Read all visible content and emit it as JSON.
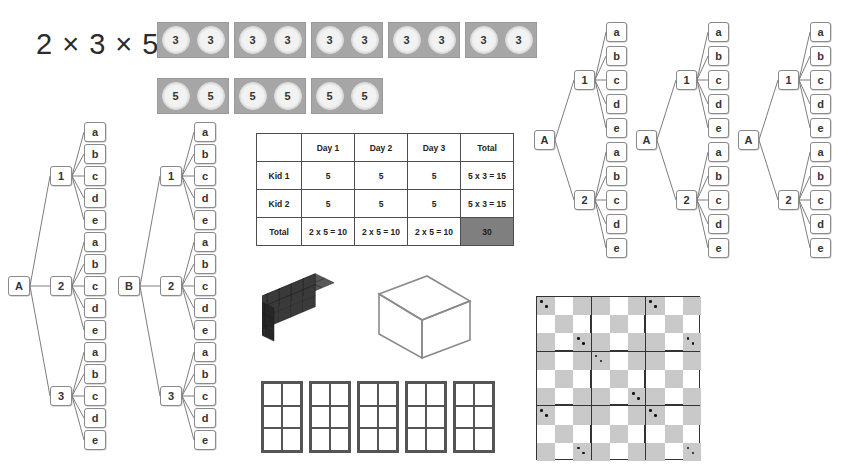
{
  "title": "2 × 3 × 5",
  "chips": {
    "rows": [
      {
        "value": "3",
        "count_boxes": 5,
        "per_box": [
          "3",
          "3"
        ]
      },
      {
        "value": "5",
        "count_boxes": 3,
        "per_box": [
          "5",
          "5"
        ]
      }
    ]
  },
  "table": {
    "corner": "",
    "columns": [
      "Day 1",
      "Day 2",
      "Day 3",
      "Total"
    ],
    "rows": [
      {
        "label": "Kid 1",
        "cells": [
          "5",
          "5",
          "5",
          "5 x 3 = 15"
        ]
      },
      {
        "label": "Kid 2",
        "cells": [
          "5",
          "5",
          "5",
          "5 x 3 = 15"
        ]
      },
      {
        "label": "Total",
        "cells": [
          "2 x 5 = 10",
          "2 x 5 = 10",
          "2 x 5 = 10",
          "30"
        ]
      }
    ],
    "grand_total": "30",
    "grand_total_bg": "#7f7f7f"
  },
  "trees_left": [
    {
      "name": "tree-A-3x5",
      "root": "A",
      "branches": [
        {
          "label": "1",
          "leaves": [
            "a",
            "b",
            "c",
            "d",
            "e"
          ]
        },
        {
          "label": "2",
          "leaves": [
            "a",
            "b",
            "c",
            "d",
            "e"
          ]
        },
        {
          "label": "3",
          "leaves": [
            "a",
            "b",
            "c",
            "d",
            "e"
          ]
        }
      ]
    },
    {
      "name": "tree-B-3x5",
      "root": "B",
      "branches": [
        {
          "label": "1",
          "leaves": [
            "a",
            "b",
            "c",
            "d",
            "e"
          ]
        },
        {
          "label": "2",
          "leaves": [
            "a",
            "b",
            "c",
            "d",
            "e"
          ]
        },
        {
          "label": "3",
          "leaves": [
            "a",
            "b",
            "c",
            "d",
            "e"
          ]
        }
      ]
    }
  ],
  "trees_right": [
    {
      "name": "tree-A-2x5-1",
      "root": "A",
      "branches": [
        {
          "label": "1",
          "leaves": [
            "a",
            "b",
            "c",
            "d",
            "e"
          ]
        },
        {
          "label": "2",
          "leaves": [
            "a",
            "b",
            "c",
            "d",
            "e"
          ]
        }
      ]
    },
    {
      "name": "tree-A-2x5-2",
      "root": "A",
      "branches": [
        {
          "label": "1",
          "leaves": [
            "a",
            "b",
            "c",
            "d",
            "e"
          ]
        },
        {
          "label": "2",
          "leaves": [
            "a",
            "b",
            "c",
            "d",
            "e"
          ]
        }
      ]
    },
    {
      "name": "tree-A-2x5-3",
      "root": "A",
      "branches": [
        {
          "label": "1",
          "leaves": [
            "a",
            "b",
            "c",
            "d",
            "e"
          ]
        },
        {
          "label": "2",
          "leaves": [
            "a",
            "b",
            "c",
            "d",
            "e"
          ]
        }
      ]
    }
  ],
  "solids": {
    "filled_block": {
      "name": "cube-stack",
      "units_x": 5,
      "units_y": 2,
      "units_z": 3,
      "color": "#3a3a3a"
    },
    "wire_box": {
      "name": "wireframe-box",
      "color": "#8a8a8a"
    }
  },
  "mini_grids": {
    "count": 5,
    "cols": 2,
    "rows": 3
  },
  "checkerboard": {
    "sub_boards": 9,
    "grid": 3,
    "squares_per_board": 9,
    "shade": "#c9c9c9"
  }
}
